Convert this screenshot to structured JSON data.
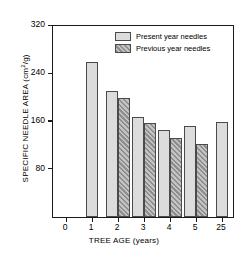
{
  "chart_data": {
    "type": "bar",
    "title": "",
    "xlabel": "TREE AGE (years)",
    "ylabel": "SPECIFIC NEEDLE AREA (cm2/g)",
    "ylabel_prefix": "SPECIFIC NEEDLE AREA (cm",
    "ylabel_exponent": "2",
    "ylabel_suffix": "/g)",
    "categories": [
      "1",
      "2",
      "3",
      "4",
      "5",
      "25"
    ],
    "xtick_labels": [
      "0",
      "1",
      "2",
      "3",
      "4",
      "5",
      "25"
    ],
    "ytick_labels": [
      "320",
      "240",
      "160",
      "80"
    ],
    "ylim": [
      0,
      320
    ],
    "yticks": [
      80,
      160,
      240,
      320
    ],
    "grid": false,
    "legend_position": "top-center",
    "series": [
      {
        "name": "Present year needles",
        "color": "#dcdcdc",
        "values": [
          260,
          211,
          168,
          146,
          152,
          160
        ]
      },
      {
        "name": "Previous year needles",
        "color": "#9a9a9a",
        "values": [
          null,
          200,
          157,
          133,
          123,
          null
        ]
      }
    ]
  },
  "legend": {
    "items": [
      {
        "label": "Present year needles",
        "style": "present"
      },
      {
        "label": "Previous year needles",
        "style": "previous"
      }
    ]
  }
}
